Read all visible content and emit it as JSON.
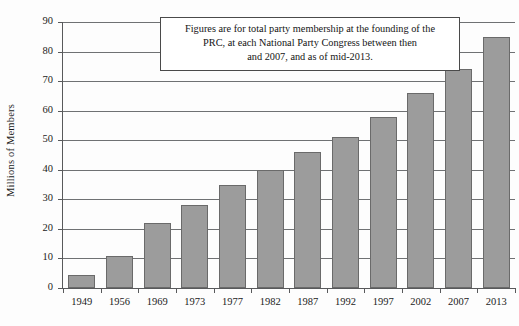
{
  "chart_data": {
    "type": "bar",
    "title": "",
    "subtitle": "",
    "xlabel": "",
    "ylabel": "Millions of Members",
    "categories": [
      "1949",
      "1956",
      "1969",
      "1973",
      "1977",
      "1982",
      "1987",
      "1992",
      "1997",
      "2002",
      "2007",
      "2013"
    ],
    "values": [
      4.5,
      10.7,
      22,
      28,
      35,
      40,
      46,
      51,
      58,
      66,
      74,
      85
    ],
    "ylim": [
      0,
      90
    ],
    "ytick_values": [
      0,
      10,
      20,
      30,
      40,
      50,
      60,
      70,
      80,
      90
    ],
    "ytick_labels": [
      "0",
      "10",
      "20",
      "30",
      "40",
      "50",
      "60",
      "70",
      "80",
      "90"
    ],
    "grid": "horizontal",
    "legend": "none",
    "annotations": [
      {
        "text": "Figures are for total party membership at the founding of the PRC, at each National Party Congress between then and 2007, and as of mid-2013.",
        "line1": "Figures are for total party membership at the founding of the",
        "line2": "PRC, at each National Party Congress between then",
        "line3": "and 2007, and as of mid-2013."
      }
    ],
    "colors": {
      "bar_fill": "#9c9c9c",
      "bar_border": "#6a6a6a",
      "gridline": "#6f7173",
      "axis": "#58595b",
      "background": "#fdfdfd",
      "text": "#1b1b1b",
      "annotation_border": "#4a4a4a"
    }
  }
}
